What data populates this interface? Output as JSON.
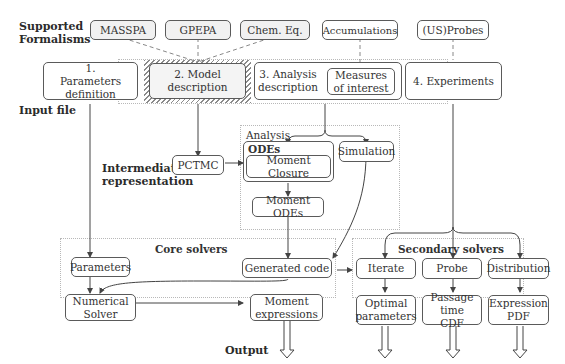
{
  "side_labels": {
    "supported_formalisms": "Supported Formalisms",
    "input_file": "Input file",
    "intermediate_representation": "Intermediate representation",
    "output": "Output"
  },
  "formalisms": [
    {
      "label": "MASSPA"
    },
    {
      "label": "GPEPA"
    },
    {
      "label": "Chem. Eq."
    },
    {
      "label": "Accumulations"
    },
    {
      "label": "(US)Probes"
    }
  ],
  "input_sections": [
    {
      "label": "1. Parameters definition"
    },
    {
      "label": "2. Model description"
    },
    {
      "label": "3. Analysis description"
    },
    {
      "label": "Measures of interest"
    },
    {
      "label": "4. Experiments"
    }
  ],
  "intermediate": {
    "pctmc": "PCTMC"
  },
  "analysis": {
    "title": "Analysis",
    "odes_title": "ODEs",
    "moment_closure": "Moment Closure",
    "simulation": "Simulation",
    "moment_odes": "Moment ODEs"
  },
  "core_solvers": {
    "title": "Core solvers",
    "parameters": "Parameters",
    "generated_code": "Generated code",
    "numerical_solver": "Numerical Solver",
    "moment_expressions": "Moment expressions"
  },
  "secondary_solvers": {
    "title": "Secondary solvers",
    "iterate": "Iterate",
    "probe": "Probe",
    "distribution": "Distribution",
    "optimal_parameters": "Optimal parameters",
    "passage_time_cdf": "Passage time CDF",
    "expression_pdf": "Expression PDF"
  }
}
